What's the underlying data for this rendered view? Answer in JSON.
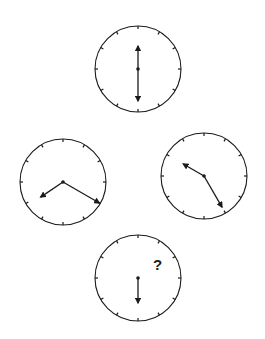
{
  "puzzle": {
    "type": "clock-sequence",
    "question_mark": "?",
    "stroke_color": "#1a1a1a",
    "background": "#ffffff",
    "clocks": [
      {
        "name": "clock-top",
        "cx": 138,
        "cy": 69,
        "r": 43,
        "hands": [
          {
            "angle_deg": 0,
            "length": 23
          },
          {
            "angle_deg": 180,
            "length": 32
          }
        ],
        "show_question": false
      },
      {
        "name": "clock-left",
        "cx": 63,
        "cy": 182,
        "r": 43,
        "hands": [
          {
            "angle_deg": 236,
            "length": 27
          },
          {
            "angle_deg": 120,
            "length": 42
          }
        ],
        "show_question": false
      },
      {
        "name": "clock-right",
        "cx": 204,
        "cy": 176,
        "r": 43,
        "hands": [
          {
            "angle_deg": 300,
            "length": 24
          },
          {
            "angle_deg": 150,
            "length": 36
          }
        ],
        "show_question": false
      },
      {
        "name": "clock-bottom",
        "cx": 138,
        "cy": 278,
        "r": 43,
        "hands": [
          {
            "angle_deg": 180,
            "length": 25
          }
        ],
        "show_question": true,
        "question_x": 153,
        "question_y": 270
      }
    ]
  }
}
